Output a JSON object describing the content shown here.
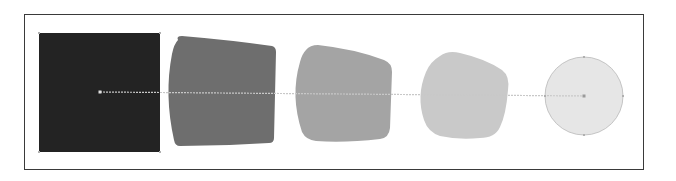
{
  "diagram": {
    "title": "",
    "frame": {
      "x": 24,
      "y": 14,
      "width": 620,
      "height": 156,
      "stroke": "#3a3a3a"
    },
    "spine": {
      "x1": 100,
      "y1": 92,
      "x2": 584,
      "y2": 96,
      "stroke": "#c8c8c8",
      "start_point": {
        "x": 100,
        "y": 92
      },
      "end_point": {
        "x": 584,
        "y": 96
      }
    },
    "steps": [
      {
        "name": "square",
        "fill": "#232323",
        "path": "M39,33 L160,33 L160,152 L39,152 Z",
        "anchors": [
          [
            39,
            33
          ],
          [
            160,
            33
          ],
          [
            160,
            152
          ],
          [
            39,
            152
          ]
        ]
      },
      {
        "name": "blend-step-1",
        "fill": "#6e6e6e",
        "path": "M178,40 Q176,36 182,36 Q230,40 272,46 Q276,47 276,52 L274,138 Q274,143 269,143 Q225,146 180,146 Q175,146 174,140 Q164,95 172,54 Q174,44 178,40 Z"
      },
      {
        "name": "blend-step-2",
        "fill": "#a4a4a4",
        "path": "M306,50 Q310,45 318,45 Q355,49 384,60 Q392,63 392,72 L390,128 Q389,138 380,139 Q345,143 316,141 Q306,140 302,132 Q290,96 300,62 Q302,54 306,50 Z"
      },
      {
        "name": "blend-step-3",
        "fill": "#c9c9c9",
        "path": "M440,56 Q448,50 460,53 Q486,59 502,70 Q510,76 508,90 Q506,115 500,127 Q495,138 480,138 Q458,140 440,136 Q428,132 424,120 Q416,96 426,72 Q430,62 440,56 Z"
      },
      {
        "name": "circle",
        "fill": "#e6e6e6",
        "stroke": "#b8b8b8",
        "cx": 584,
        "cy": 96,
        "r": 39,
        "anchors": [
          [
            584,
            57
          ],
          [
            623,
            96
          ],
          [
            584,
            135
          ],
          [
            545,
            96
          ]
        ]
      }
    ]
  }
}
